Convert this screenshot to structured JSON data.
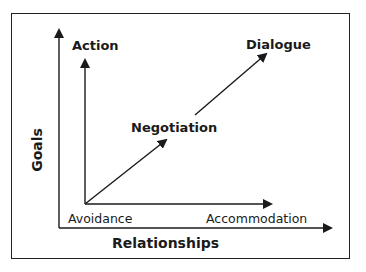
{
  "diagram": {
    "type": "conflict-style-framework",
    "axes": {
      "x_label": "Relationships",
      "y_label": "Goals"
    },
    "nodes": {
      "origin": "Avoidance",
      "top_left": "Action",
      "bottom_right": "Accommodation",
      "middle": "Negotiation",
      "top_right": "Dialogue"
    },
    "edges": [
      {
        "from": "Avoidance",
        "to": "Action",
        "direction": "up"
      },
      {
        "from": "Avoidance",
        "to": "Accommodation",
        "direction": "right"
      },
      {
        "from": "Avoidance",
        "to": "Negotiation",
        "direction": "diagonal"
      },
      {
        "from": "Negotiation",
        "to": "Dialogue",
        "direction": "diagonal"
      }
    ],
    "colors": {
      "line": "#1a1a1a",
      "background": "#ffffff"
    }
  }
}
